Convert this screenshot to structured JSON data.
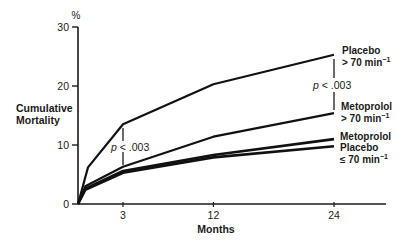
{
  "chart_data": {
    "type": "line",
    "title": "",
    "ylabel": "Cumulative Mortality",
    "ylabel_lines": [
      "Cumulative",
      "Mortality"
    ],
    "yunit": "%",
    "xlabel": "Months",
    "ylim": [
      0,
      30
    ],
    "xlim": [
      0,
      28
    ],
    "yticks": [
      0,
      10,
      20,
      30
    ],
    "ytick_labels": [
      "0",
      "10",
      "20",
      "30"
    ],
    "xticks": [
      3,
      12,
      24
    ],
    "xtick_labels": [
      "3",
      "12",
      "24"
    ],
    "grid": false,
    "legend_position": "inline-right",
    "x": [
      0,
      0.7,
      3,
      12,
      24
    ],
    "series": [
      {
        "name": "Placebo > 70 min⁻¹",
        "label_lines": [
          "Placebo",
          "> 70 min⁻¹"
        ],
        "values": [
          0,
          6.2,
          13.5,
          20.3,
          25.3
        ]
      },
      {
        "name": "Metoprolol > 70 min⁻¹",
        "label_lines": [
          "Metoprolol",
          "> 70 min⁻¹"
        ],
        "values": [
          0,
          3.0,
          6.3,
          11.4,
          15.4
        ]
      },
      {
        "name": "Metoprolol ≤ 70 min⁻¹",
        "label_lines": [
          "Metoprolol"
        ],
        "values": [
          0,
          2.6,
          5.6,
          8.3,
          11.0
        ]
      },
      {
        "name": "Placebo ≤ 70 min⁻¹",
        "label_lines": [
          "Placebo",
          "≤ 70 min⁻¹"
        ],
        "values": [
          0,
          2.4,
          5.3,
          7.9,
          9.8
        ]
      }
    ],
    "annotations": [
      {
        "text": "p < .003",
        "x": 3,
        "between": [
          "Placebo > 70 min⁻¹",
          "Metoprolol > 70 min⁻¹"
        ]
      },
      {
        "text": "p < .003",
        "x": 24,
        "between": [
          "Placebo > 70 min⁻¹",
          "Metoprolol > 70 min⁻¹"
        ]
      }
    ]
  },
  "labels": {
    "yunit": "%",
    "ylabel_1": "Cumulative",
    "ylabel_2": "Mortality",
    "xlabel": "Months",
    "p_left_italic": "p",
    "p_left_rest": " < .003",
    "p_right_italic": "p",
    "p_right_rest": " < .003",
    "s1_l1": "Placebo",
    "s1_l2": "> 70 min",
    "s2_l1": "Metoprolol",
    "s2_l2": "> 70 min",
    "s3_l1": "Metoprolol",
    "s4_l1": "Placebo",
    "s4_l2": "≤ 70 min",
    "sup": "−1"
  }
}
